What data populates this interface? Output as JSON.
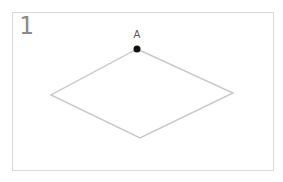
{
  "panel": {
    "number": "1"
  },
  "diagram": {
    "shape": "rhombus",
    "stroke_color": "#c8c8c8",
    "point_color": "#111111",
    "vertices": {
      "top": {
        "x": 137,
        "y": 49,
        "label": "A"
      },
      "right": {
        "x": 233,
        "y": 93
      },
      "bottom": {
        "x": 140,
        "y": 138
      },
      "left": {
        "x": 51,
        "y": 95
      }
    }
  }
}
